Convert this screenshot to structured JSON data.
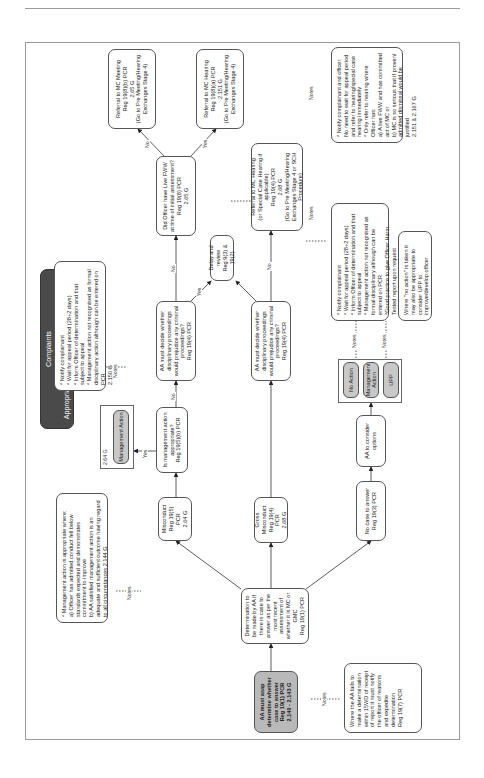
{
  "title": {
    "line1": "Complaints",
    "line2": "(PRA Matter)",
    "line3": "Appropriate Authority Determination Stage 3"
  },
  "nodes": {
    "start": "AA must asap determine whether case to answer\nReg 19(1) PCR\n2.140 - 2.143 G",
    "start_note": "Where the AA fails to make a determination within 15WD of receipt of report it must notify the officer of reasons and expedite determination\nReg 19(7) PCR",
    "determination": "Determination to be made by AA if there is case to answer as per the most recent assessment of whether it is MC or GMC\nReg 19(1) PCR",
    "misconduct": "Misconduct\nReg 19(5) PCR\n2.64 G",
    "gross_misconduct": "Gross Misconduct\nReg 19(4) PCR\n2.68 G",
    "no_case": "No case to answer\nReg 19(3) PCR",
    "consider_options": "AA to consider options",
    "mgmt_appropriate": "Is management action appropriate?\nReg 19(5)(b) PCR",
    "mgmt_note": "* Management action is appropriate where:\na) Officer has admitted conduct fell below standards expected and demonstrates commitment to improve\nb) AA satisfied management action is an adequate and sufficient outcome having regard to all circumstances 2.144 G",
    "mgmt_action_ref": "2.64 G",
    "mgmt_action_pill": "Management Action",
    "mgmt_action_note": "* Notify complainant\n* Wait for appeal period (28+2 days)\n* Inform Officer of determination and that subject to appeal\n* Management action not recognised as formal disciplinary action although can be entered on PCR\n2.150 G",
    "prejudice_mc": "AA must decide whether disciplinary proceedings would prejudice any criminal proceedings?\nReg 19(4) PCR",
    "prejudice_gmc": "AA must decide whether disciplinary proceedings would prejudice any criminal proceedings?\nReg 19(4) PCR",
    "delay_review": "Delay and review\nReg 9(3) & 19(2)",
    "live_fww": "Did Officer have Live FWW at time of initial assessment?\nReg 19(8) PCR\n2.65 G",
    "mc_meeting": "Referral to MC Meeting\nReg 19(8)(b) PCR\n2.65 G\n(Go to Pre Meeting/Hearing Exchanges Stage 4)",
    "mc_hearing_fww": "Referral to MC Hearing\nReg 19(8)(a) PCR\n2.151 G\n(Go to Pre Meeting/Hearing Exchanges Stage 4)",
    "mc_hearing_fww_note": "* Notify complainant and officer. No need to wait for appeal period and refer to hearing/special case hearing immediately\n* Only refer to hearing where Officer has:\na) A live FWW and has committed act of MC or\nb) MC is so serious that if proven/ admitted dismissal would be justified\n2.151 & 2.167 G",
    "gmc_hearing": "Referral to MC Hearing\n(or Special Case Hearing if applicable)\nReg 19(4) PCR\n2.68 G\n(Go to Pre Meeting/Hearing Exchanges Stage 4 or SCH Procedure)",
    "options_note": "* Notify complainant\n* Wait for appeal period (28+2 days)\n* Inform Officer of determination and that subject to appeal\n* Management action not recognised as formal disciplinary although can be entered on PCR\n*Good practice to give Officer Harm Tested report upon request\n2.150 & 2.142 G",
    "upp_note": "Where \"no action\" is taken it may also be appropriate to consider UPP to improve/develop officer",
    "option_no_action": "No Action",
    "option_mgmt_action": "Management Action",
    "option_upp": "UPP"
  },
  "edge_labels": {
    "yes": "Yes",
    "no": "No",
    "notes": "Notes"
  },
  "colors": {
    "dark_box": "#4a4a4a",
    "grey_box": "#b9b9b9",
    "pill": "#c8c8c8",
    "border": "#555555",
    "frame": "#9a9a9a"
  }
}
